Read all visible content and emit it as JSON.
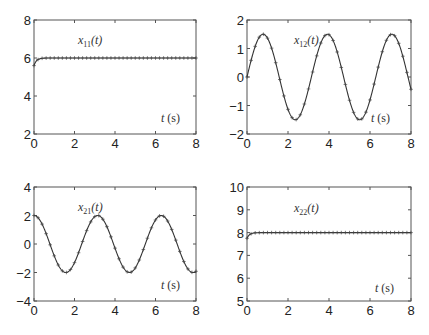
{
  "chart_data": [
    {
      "type": "line",
      "title": "",
      "annotation": "x11(t)",
      "annotation_var": "x",
      "annotation_sub": "11",
      "xlabel_annotation": "t (s)",
      "xlim": [
        0,
        8
      ],
      "ylim": [
        2,
        8
      ],
      "xticks": [
        0,
        2,
        4,
        6,
        8
      ],
      "yticks": [
        2,
        4,
        6,
        8
      ],
      "grid": false,
      "description": "Rapid rise from ~5.6 at t=0 settling to 6 by t~0.5",
      "function": "6 - 0.4*exp(-8t)",
      "series": [
        {
          "name": "solid line",
          "style": "solid",
          "x": [
            0,
            0.1,
            0.2,
            0.3,
            0.5,
            1,
            2,
            4,
            6,
            8
          ],
          "y": [
            5.6,
            5.82,
            5.92,
            5.96,
            5.99,
            6,
            6,
            6,
            6,
            6
          ]
        },
        {
          "name": "+ markers",
          "style": "plus",
          "spacing": 0.2
        }
      ]
    },
    {
      "type": "line",
      "title": "",
      "annotation": "x12(t)",
      "annotation_var": "x",
      "annotation_sub": "12",
      "xlabel_annotation": "t (s)",
      "xlim": [
        0,
        8
      ],
      "ylim": [
        -2,
        2
      ],
      "xticks": [
        0,
        2,
        4,
        6,
        8
      ],
      "yticks": [
        -2,
        -1,
        0,
        1,
        2
      ],
      "grid": false,
      "description": "Sinusoid amplitude 1.5, period pi, starting at 0",
      "function": "1.5*sin(2t)",
      "series": [
        {
          "name": "solid line",
          "style": "solid",
          "peaks_t": [
            0.79,
            3.93,
            7.07
          ],
          "troughs_t": [
            2.36,
            5.5
          ],
          "amplitude": 1.5
        },
        {
          "name": "+ markers",
          "style": "plus",
          "spacing": 0.2
        }
      ]
    },
    {
      "type": "line",
      "title": "",
      "annotation": "x21(t)",
      "annotation_var": "x",
      "annotation_sub": "21",
      "xlabel_annotation": "t (s)",
      "xlim": [
        0,
        8
      ],
      "ylim": [
        -4,
        4
      ],
      "xticks": [
        0,
        2,
        4,
        6,
        8
      ],
      "yticks": [
        -4,
        -2,
        0,
        2,
        4
      ],
      "grid": false,
      "description": "Cosine amplitude 2, period pi, starting at 2",
      "function": "2*cos(2t)",
      "series": [
        {
          "name": "solid line",
          "style": "solid",
          "peaks_t": [
            0,
            3.14,
            6.28
          ],
          "troughs_t": [
            1.57,
            4.71,
            7.85
          ],
          "amplitude": 2
        },
        {
          "name": "+ markers",
          "style": "plus",
          "spacing": 0.2
        }
      ]
    },
    {
      "type": "line",
      "title": "",
      "annotation": "x22(t)",
      "annotation_var": "x",
      "annotation_sub": "22",
      "xlabel_annotation": "t (s)",
      "xlim": [
        0,
        8
      ],
      "ylim": [
        5,
        10
      ],
      "xticks": [
        0,
        2,
        4,
        6,
        8
      ],
      "yticks": [
        5,
        6,
        7,
        8,
        9,
        10
      ],
      "grid": false,
      "description": "Rapid rise from ~7.75 at t=0 settling to 8 by t~0.5",
      "function": "8 - 0.25*exp(-8t)",
      "series": [
        {
          "name": "solid line",
          "style": "solid",
          "x": [
            0,
            0.1,
            0.2,
            0.3,
            0.5,
            1,
            2,
            4,
            6,
            8
          ],
          "y": [
            7.75,
            7.89,
            7.95,
            7.98,
            7.99,
            8,
            8,
            8,
            8,
            8
          ]
        },
        {
          "name": "+ markers",
          "style": "plus",
          "spacing": 0.2
        }
      ]
    }
  ],
  "labels": {
    "p11": {
      "var": "x",
      "sub": "11",
      "paren": "(t)",
      "time": "t",
      "unit": " (s)"
    },
    "p12": {
      "var": "x",
      "sub": "12",
      "paren": "(t)",
      "time": "t",
      "unit": " (s)"
    },
    "p21": {
      "var": "x",
      "sub": "21",
      "paren": "(t)",
      "time": "t",
      "unit": " (s)"
    },
    "p22": {
      "var": "x",
      "sub": "22",
      "paren": "(t)",
      "time": "t",
      "unit": " (s)"
    }
  }
}
